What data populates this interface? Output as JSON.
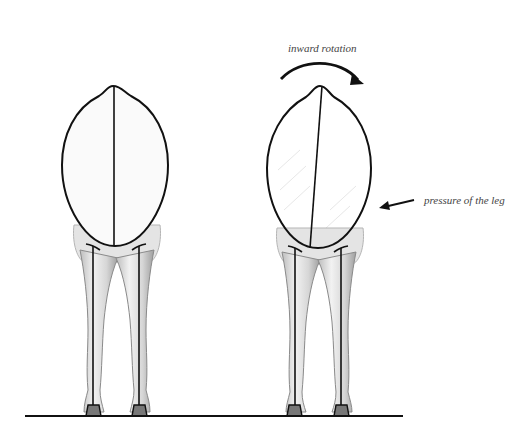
{
  "diagram": {
    "colors": {
      "outline": "#111111",
      "leg_fill": "#e6e6e6",
      "leg_shade": "#9a9a9a",
      "label": "#444444",
      "background": "#ffffff"
    },
    "figures": [
      {
        "id": "neutral",
        "center_x": 115,
        "body_axis": "vertical"
      },
      {
        "id": "rotated",
        "center_x": 318,
        "body_axis": "tilted"
      }
    ],
    "annotations": {
      "rotation_label": "inward rotation",
      "pressure_label": "pressure of the leg"
    },
    "icons": {
      "rotation_arrow": "curved-arrow-right",
      "pressure_arrow": "arrow-left"
    },
    "ground_line": {
      "x1": 25,
      "x2": 403,
      "y": 416
    }
  }
}
